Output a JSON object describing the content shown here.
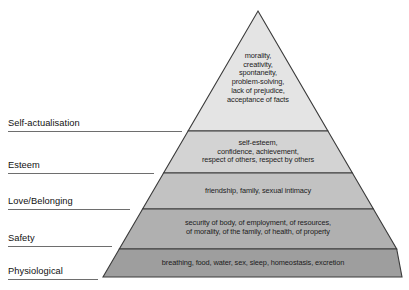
{
  "diagram": {
    "type": "pyramid",
    "geometry": {
      "apex_x": 258,
      "apex_y": 11,
      "base_left_x": 103,
      "base_right_x": 402,
      "base_y": 277,
      "divider_y": [
        131,
        173,
        209,
        249
      ]
    },
    "tiers": [
      {
        "id": "self-actualisation",
        "label": "Self-actualisation",
        "fill": "#e4e4e4",
        "stroke": "#3a3a3a",
        "contents": "morality,\ncreativity,\nspontaneity,\nproblem-solving,\nlack of prejudice,\nacceptance of facts"
      },
      {
        "id": "esteem",
        "label": "Esteem",
        "fill": "#d3d3d3",
        "stroke": "#3a3a3a",
        "contents": "self-esteem,\nconfidence, achievement,\nrespect of others, respect by others"
      },
      {
        "id": "love-belonging",
        "label": "Love/Belonging",
        "fill": "#c2c2c2",
        "stroke": "#3a3a3a",
        "contents": "friendship, family, sexual intimacy"
      },
      {
        "id": "safety",
        "label": "Safety",
        "fill": "#b0b0b0",
        "stroke": "#3a3a3a",
        "contents": "security of body, of employment, of resources,\nof morality, of the family, of health, of property"
      },
      {
        "id": "physiological",
        "label": "Physiological",
        "fill": "#9e9e9e",
        "stroke": "#3a3a3a",
        "contents": "breathing, food, water, sex, sleep, homeostasis, excretion"
      }
    ]
  }
}
